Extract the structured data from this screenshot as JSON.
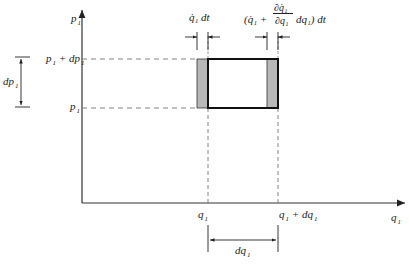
{
  "figure": {
    "axes": {
      "y_label": {
        "main": "p",
        "sub": "1"
      },
      "x_label": {
        "main": "q",
        "sub": "1"
      }
    },
    "y_ticks": [
      {
        "main": "p",
        "sub": "1",
        "suffix": " + d",
        "main2": "p",
        "sub2": "1",
        "id": "p1-plus-dp1"
      },
      {
        "main": "p",
        "sub": "1",
        "id": "p1"
      }
    ],
    "x_ticks": [
      {
        "main": "q",
        "sub": "1",
        "id": "q1"
      },
      {
        "main": "q",
        "sub": "1",
        "suffix": " + d",
        "main2": "q",
        "sub2": "1",
        "id": "q1-plus-dq1"
      }
    ],
    "dimensions": {
      "dp": {
        "prefix": "d",
        "main": "p",
        "sub": "1"
      },
      "dq": {
        "prefix": "d",
        "main": "q",
        "sub": "1"
      }
    },
    "flux_labels": {
      "inflow": "q̇₁ dt",
      "outflow_open": "(q̇₁ +",
      "outflow_num": "∂q̇₁",
      "outflow_den": "∂q₁",
      "outflow_close": "dq₁) dt"
    },
    "colors": {
      "axis": "#333333",
      "box": "#111111",
      "shade": "#b8b8b8",
      "dash": "#777777"
    }
  }
}
